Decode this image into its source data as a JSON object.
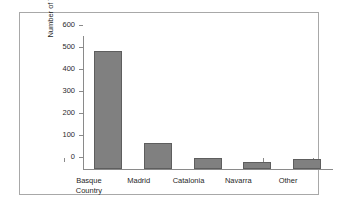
{
  "chart_data": {
    "type": "bar",
    "title": "",
    "subtitle": "",
    "xlabel": "",
    "ylabel": "Number of Victims",
    "categories": [
      "Basque\nCountry",
      "Madrid",
      "Catalonia",
      "Navarra",
      "Other"
    ],
    "values": [
      537,
      118,
      52,
      32,
      46
    ],
    "ylim": [
      0,
      600
    ],
    "yticks": [
      0,
      100,
      200,
      300,
      400,
      500,
      600
    ],
    "ytick_labels": [
      "0",
      "100",
      "200",
      "300",
      "400",
      "500",
      "600"
    ],
    "grid": false,
    "legend": null,
    "bar_color": "#808080",
    "bar_edge_color": "#5e5e5e",
    "axis_color": "#8a8a8a",
    "frame_color": "#a8a8a8",
    "background": "#ffffff"
  }
}
